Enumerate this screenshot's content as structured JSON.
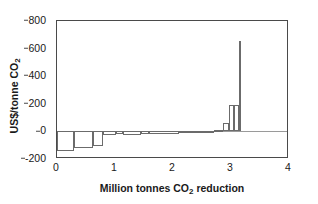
{
  "chart_data": {
    "type": "bar",
    "title": "",
    "subtitle": "",
    "xlabel": "Million tonnes CO2 reduction",
    "ylabel": "US$/tonne CO2",
    "xlim": [
      0,
      4
    ],
    "ylim": [
      -200,
      800
    ],
    "xticks": [
      0,
      1,
      2,
      3,
      4
    ],
    "xtick_labels": [
      "0",
      "1",
      "2",
      "3",
      "4"
    ],
    "yticks": [
      -200,
      0,
      200,
      400,
      600,
      800
    ],
    "ytick_labels": [
      "-200",
      "0",
      "200",
      "400",
      "600",
      "800"
    ],
    "grid": false,
    "legend": "none",
    "chart_style": "marginal-abatement-cost-curve",
    "note": "Stepped cost curve: bar width = CO2 reduction (Mt), bar height = cost (US$/tonne). Bars drawn as hollow outlines ordered by increasing cost.",
    "bars": [
      {
        "x_start": 0.0,
        "x_end": 0.3,
        "width": 0.3,
        "value": -145
      },
      {
        "x_start": 0.3,
        "x_end": 0.62,
        "width": 0.32,
        "value": -118
      },
      {
        "x_start": 0.62,
        "x_end": 0.8,
        "width": 0.18,
        "value": -105
      },
      {
        "x_start": 0.8,
        "x_end": 1.02,
        "width": 0.22,
        "value": -28
      },
      {
        "x_start": 1.02,
        "x_end": 1.14,
        "width": 0.12,
        "value": -22
      },
      {
        "x_start": 1.14,
        "x_end": 1.45,
        "width": 0.31,
        "value": -25
      },
      {
        "x_start": 1.45,
        "x_end": 1.58,
        "width": 0.13,
        "value": -22
      },
      {
        "x_start": 1.58,
        "x_end": 2.1,
        "width": 0.52,
        "value": -16
      },
      {
        "x_start": 2.1,
        "x_end": 2.35,
        "width": 0.25,
        "value": -12
      },
      {
        "x_start": 2.35,
        "x_end": 2.55,
        "width": 0.2,
        "value": -10
      },
      {
        "x_start": 2.55,
        "x_end": 2.7,
        "width": 0.15,
        "value": 5
      },
      {
        "x_start": 2.7,
        "x_end": 2.86,
        "width": 0.16,
        "value": 10
      },
      {
        "x_start": 2.86,
        "x_end": 2.96,
        "width": 0.1,
        "value": 60
      },
      {
        "x_start": 2.96,
        "x_end": 3.05,
        "width": 0.09,
        "value": 190
      },
      {
        "x_start": 3.05,
        "x_end": 3.13,
        "width": 0.08,
        "value": 190
      },
      {
        "x_start": 3.13,
        "x_end": 3.17,
        "width": 0.04,
        "value": 655
      }
    ]
  },
  "axis": {
    "y_title": "US$/tonne CO",
    "y_title_sub": "2",
    "x_title": "Million tonnes CO",
    "x_title_sub": "2",
    "x_title_tail": " reduction"
  },
  "colors": {
    "frame": "#4a4a4a",
    "bar_outline": "#6b6b6b",
    "zero_line": "#9a9a9a",
    "text": "#1a1a1a",
    "background": "#ffffff"
  }
}
